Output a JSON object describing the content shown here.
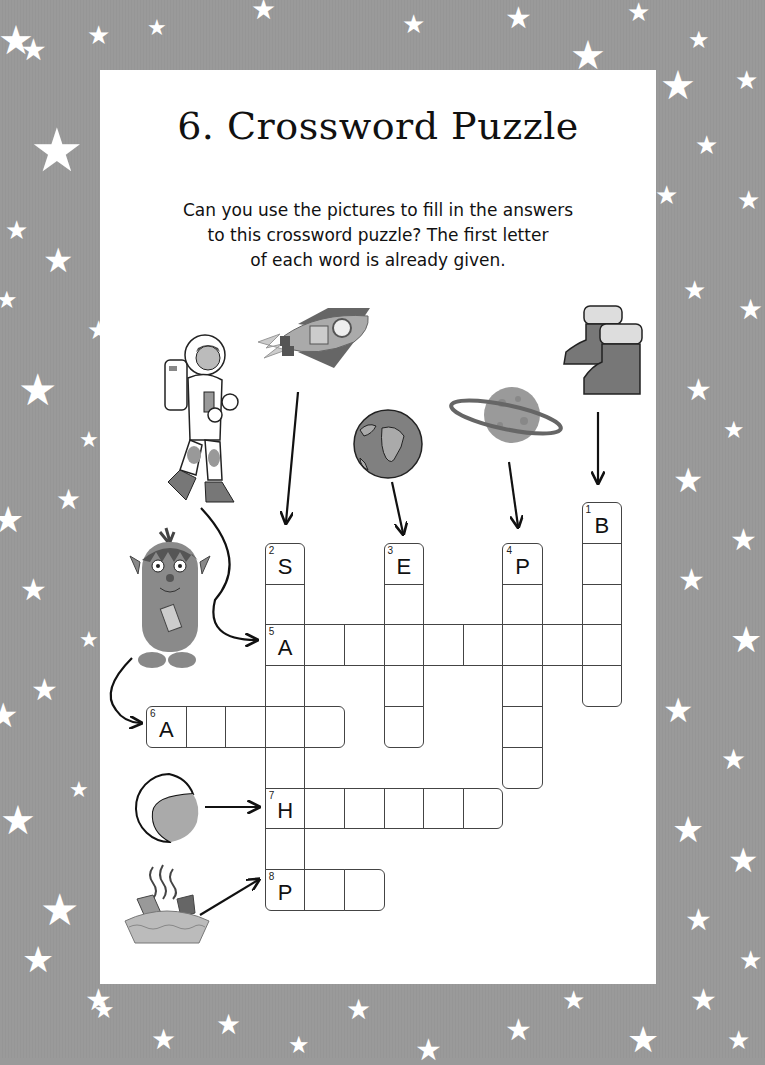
{
  "page": {
    "title": "6. Crossword Puzzle",
    "instructions": [
      "Can you use the pictures to fill in the answers",
      "to this crossword puzzle? The first letter",
      "of each word is already given."
    ]
  },
  "colors": {
    "border_background": "#9a9a9a",
    "panel": "#ffffff",
    "grid_line": "#444444",
    "text": "#111111"
  },
  "pictures": [
    {
      "name": "astronaut",
      "clue": 5
    },
    {
      "name": "rocket",
      "clue": 2
    },
    {
      "name": "earth",
      "clue": 3
    },
    {
      "name": "planet",
      "clue": 4
    },
    {
      "name": "boots",
      "clue": 1
    },
    {
      "name": "alien",
      "clue": 6
    },
    {
      "name": "helmet",
      "clue": 7
    },
    {
      "name": "pie",
      "clue": 8
    }
  ],
  "crossword": {
    "clues": [
      {
        "number": "1",
        "first_letter": "B",
        "direction": "down",
        "length": 5
      },
      {
        "number": "2",
        "first_letter": "S",
        "direction": "down",
        "length": 9
      },
      {
        "number": "3",
        "first_letter": "E",
        "direction": "down",
        "length": 5
      },
      {
        "number": "4",
        "first_letter": "P",
        "direction": "down",
        "length": 6
      },
      {
        "number": "5",
        "first_letter": "A",
        "direction": "across",
        "length": 9
      },
      {
        "number": "6",
        "first_letter": "A",
        "direction": "across",
        "length": 5
      },
      {
        "number": "7",
        "first_letter": "H",
        "direction": "across",
        "length": 6
      },
      {
        "number": "8",
        "first_letter": "P",
        "direction": "across",
        "length": 3
      }
    ]
  }
}
